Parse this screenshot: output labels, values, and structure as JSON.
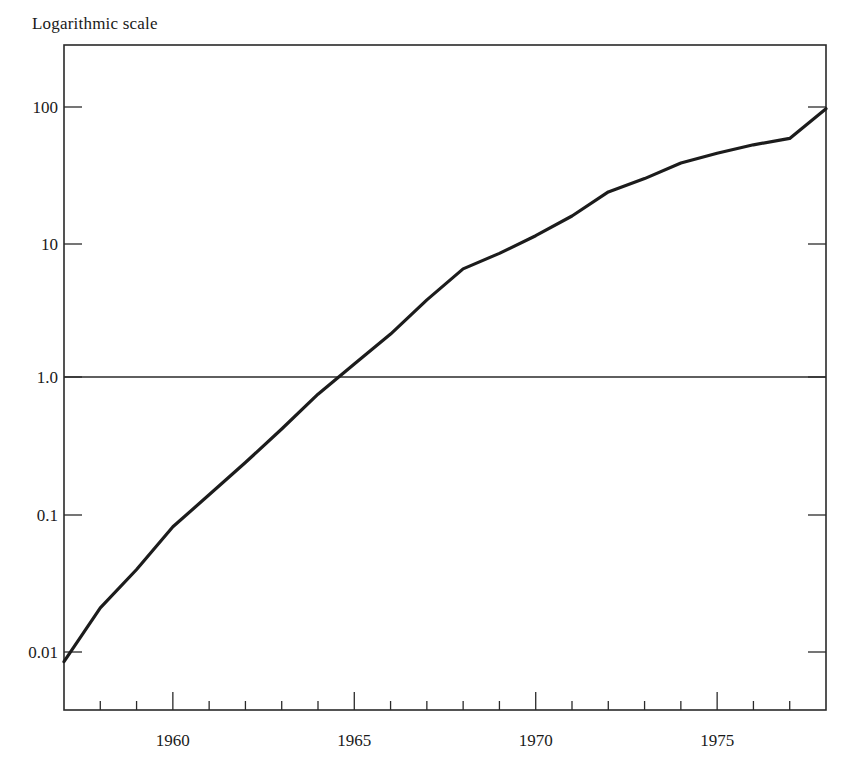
{
  "chart_data": {
    "type": "line",
    "title": "Logarithmic scale",
    "xlabel": "",
    "ylabel": "",
    "yscale": "log",
    "xlim": [
      1957,
      1978
    ],
    "ylim": [
      0.0032,
      316
    ],
    "grid": false,
    "legend": null,
    "x_tick_labels": [
      "1960",
      "1965",
      "1970",
      "1975"
    ],
    "x_major_ticks": [
      1960,
      1965,
      1970,
      1975
    ],
    "x_minor_ticks": [
      1958,
      1959,
      1961,
      1962,
      1963,
      1964,
      1966,
      1967,
      1968,
      1969,
      1971,
      1972,
      1973,
      1974,
      1976,
      1977
    ],
    "y_tick_labels": [
      "0.01",
      "0.1",
      "1.0",
      "10",
      "100"
    ],
    "y_ticks": [
      0.01,
      0.1,
      1,
      10,
      100
    ],
    "reference_lines": [
      {
        "axis": "y",
        "value": 1.0
      }
    ],
    "x": [
      1957,
      1958,
      1959,
      1960,
      1961,
      1962,
      1963,
      1964,
      1965,
      1966,
      1967,
      1968,
      1969,
      1970,
      1971,
      1972,
      1973,
      1974,
      1975,
      1976,
      1977,
      1978
    ],
    "series": [
      {
        "name": "series",
        "values": [
          0.0085,
          0.021,
          0.04,
          0.082,
          0.14,
          0.24,
          0.42,
          0.75,
          1.25,
          2.1,
          3.8,
          6.5,
          8.5,
          11.5,
          16,
          24,
          30,
          39,
          46,
          53,
          59,
          97
        ]
      }
    ]
  },
  "labels": {
    "title": "Logarithmic scale"
  }
}
